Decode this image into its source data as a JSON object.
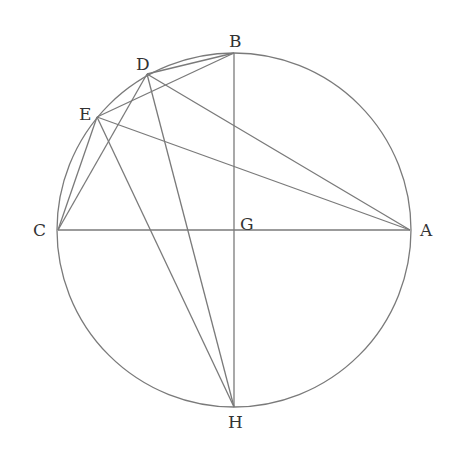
{
  "diagram": {
    "type": "geometric-construction",
    "colors": {
      "line": "#7a7a7a",
      "label": "#333333",
      "background": "#ffffff"
    },
    "circle": {
      "center": "G",
      "cx": 234,
      "cy": 230,
      "r": 177
    },
    "points": {
      "A": {
        "x": 410,
        "y": 230,
        "label": "A",
        "lx": 420,
        "ly": 236
      },
      "B": {
        "x": 234,
        "y": 53,
        "label": "B",
        "lx": 229,
        "ly": 47
      },
      "C": {
        "x": 58,
        "y": 230,
        "label": "C",
        "lx": 33,
        "ly": 236
      },
      "D": {
        "x": 147,
        "y": 74,
        "label": "D",
        "lx": 136,
        "ly": 70
      },
      "E": {
        "x": 97,
        "y": 117,
        "label": "E",
        "lx": 79,
        "ly": 120
      },
      "G": {
        "x": 234,
        "y": 230,
        "label": "G",
        "lx": 240,
        "ly": 230
      },
      "H": {
        "x": 234,
        "y": 407,
        "label": "H",
        "lx": 228,
        "ly": 428
      }
    },
    "segments": [
      [
        "C",
        "A"
      ],
      [
        "B",
        "H"
      ],
      [
        "B",
        "D"
      ],
      [
        "B",
        "E"
      ],
      [
        "D",
        "C"
      ],
      [
        "D",
        "A"
      ],
      [
        "D",
        "H"
      ],
      [
        "E",
        "C"
      ],
      [
        "E",
        "A"
      ],
      [
        "E",
        "H"
      ]
    ],
    "label_order": [
      "A",
      "B",
      "C",
      "D",
      "E",
      "G",
      "H"
    ]
  }
}
